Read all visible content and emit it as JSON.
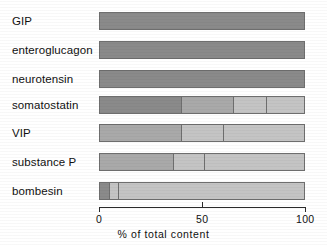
{
  "chart_data": {
    "type": "bar",
    "orientation": "horizontal",
    "stacked": true,
    "title": "",
    "xlabel": "% of total content",
    "ylabel": "",
    "xlim": [
      0,
      100
    ],
    "xticks": [
      0,
      50,
      100
    ],
    "xtick_labels": [
      "0",
      "50",
      "100"
    ],
    "grid": false,
    "legend": "none",
    "categories": [
      "GIP",
      "enteroglucagon",
      "neurotensin",
      "somatostatin",
      "VIP",
      "substance P",
      "bombesin"
    ],
    "colors": {
      "dark": "#8a8a8a",
      "medium": "#a9a9a9",
      "light": "#c4c4c4",
      "pale": "#d2d2d2",
      "outline": "#6e6e6e",
      "axis": "#2b2b2b",
      "text": "#101010",
      "background": "#ffffff"
    },
    "rows": [
      {
        "category": "GIP",
        "segments": [
          {
            "start": 0,
            "end": 100,
            "value": 100,
            "shade": "dark"
          }
        ]
      },
      {
        "category": "enteroglucagon",
        "segments": [
          {
            "start": 0,
            "end": 100,
            "value": 100,
            "shade": "dark"
          }
        ]
      },
      {
        "category": "neurotensin",
        "segments": [
          {
            "start": 0,
            "end": 100,
            "value": 100,
            "shade": "dark"
          }
        ]
      },
      {
        "category": "somatostatin",
        "segments": [
          {
            "start": 0,
            "end": 40,
            "value": 40,
            "shade": "dark"
          },
          {
            "start": 40,
            "end": 65,
            "value": 25,
            "shade": "medium"
          },
          {
            "start": 65,
            "end": 81,
            "value": 16,
            "shade": "light"
          },
          {
            "start": 81,
            "end": 100,
            "value": 19,
            "shade": "light"
          }
        ]
      },
      {
        "category": "VIP",
        "segments": [
          {
            "start": 0,
            "end": 40,
            "value": 40,
            "shade": "medium"
          },
          {
            "start": 40,
            "end": 60,
            "value": 20,
            "shade": "light"
          },
          {
            "start": 60,
            "end": 100,
            "value": 40,
            "shade": "light"
          }
        ]
      },
      {
        "category": "substance P",
        "segments": [
          {
            "start": 0,
            "end": 36,
            "value": 36,
            "shade": "medium"
          },
          {
            "start": 36,
            "end": 51,
            "value": 15,
            "shade": "light"
          },
          {
            "start": 51,
            "end": 100,
            "value": 49,
            "shade": "light"
          }
        ]
      },
      {
        "category": "bombesin",
        "segments": [
          {
            "start": 0,
            "end": 5,
            "value": 5,
            "shade": "dark"
          },
          {
            "start": 5,
            "end": 9,
            "value": 4,
            "shade": "light"
          },
          {
            "start": 9,
            "end": 100,
            "value": 91,
            "shade": "light"
          }
        ]
      }
    ]
  }
}
